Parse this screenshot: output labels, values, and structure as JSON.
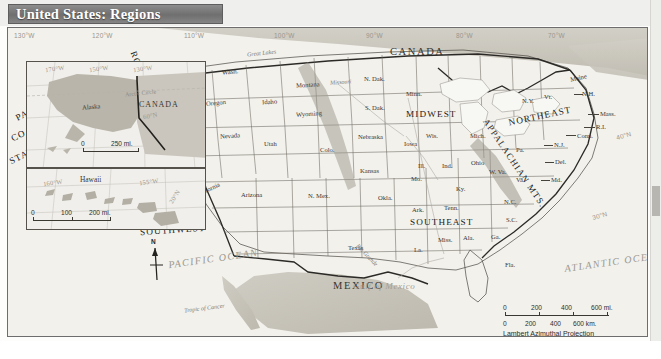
{
  "title": "United States: Regions",
  "map": {
    "countries": [
      "CANADA",
      "MEXICO"
    ],
    "oceans": [
      "PACIFIC OCEAN",
      "ATLANTIC OCEAN"
    ],
    "gulf": "Gulf of Mexico",
    "tropic": "Tropic of Cancer",
    "ranges": [
      "ROCKY",
      "MOUNTAINS",
      "APPALACHIAN MTS."
    ],
    "great_lakes": "Great Lakes",
    "rio": "Rio Grande",
    "missouri": "Missouri",
    "regions": [
      {
        "name": "PACIFIC",
        "line2": "COAST",
        "line3": "STATES"
      },
      {
        "name": "ROCKY",
        "line2": "MOUNTAIN",
        "line3": "STATES"
      },
      {
        "name": "SOUTHWEST"
      },
      {
        "name": "MIDWEST"
      },
      {
        "name": "NORTHEAST"
      },
      {
        "name": "SOUTHEAST"
      }
    ],
    "states": [
      "Wash.",
      "Oregon",
      "Idaho",
      "Montana",
      "Wyoming",
      "N. Dak.",
      "S. Dak.",
      "Nebraska",
      "Minn.",
      "Wis.",
      "Iowa",
      "Ill.",
      "Ind.",
      "Mich.",
      "Ohio",
      "Nevada",
      "California",
      "Utah",
      "Colo.",
      "Arizona",
      "N. Mex.",
      "Kansas",
      "Okla.",
      "Texas",
      "Mo.",
      "Ark.",
      "La.",
      "Miss.",
      "Ala.",
      "Ga.",
      "Fla.",
      "Tenn.",
      "Ky.",
      "N.C.",
      "S.C.",
      "Va.",
      "W. Va.",
      "Md.",
      "Del.",
      "N.J.",
      "Pa.",
      "N.Y.",
      "Vt.",
      "N.H.",
      "Maine",
      "Mass.",
      "R.I.",
      "Conn."
    ],
    "longitude_labels": [
      "130°W",
      "120°W",
      "110°W",
      "100°W",
      "90°W",
      "80°W",
      "70°W"
    ],
    "latitude_labels": [
      "40°N",
      "30°N"
    ],
    "compass": "N",
    "scale": {
      "miles": [
        "0",
        "200",
        "400",
        "600 mi."
      ],
      "km": [
        "0",
        "200",
        "400",
        "600 km."
      ],
      "projection": "Lambert Azimuthal Projection"
    }
  },
  "inset_alaska": {
    "title_land": "Alaska",
    "country": "CANADA",
    "arctic": "Arctic Circle",
    "lon_labels": [
      "170°W",
      "150°W",
      "130°W"
    ],
    "lat_label": "60°N",
    "scale": [
      "0",
      "250 mi."
    ]
  },
  "inset_hawaii": {
    "title_land": "Hawaii",
    "lon_labels": [
      "160°W",
      "155°W"
    ],
    "lat_label": "20°N",
    "scale": [
      "0",
      "100",
      "200 mi."
    ]
  }
}
